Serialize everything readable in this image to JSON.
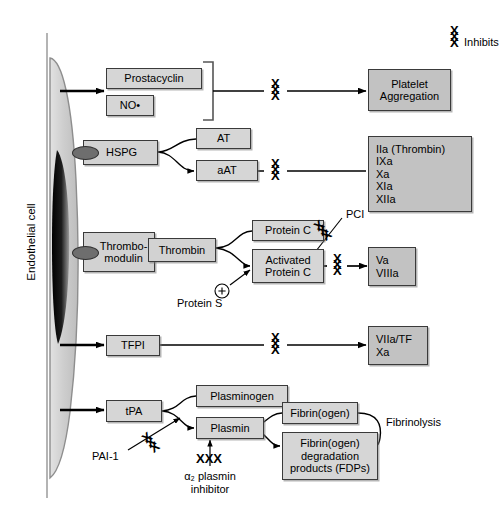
{
  "figure": {
    "cell_label": "Endothelial cell",
    "legend": {
      "symbol": "XXX",
      "text": "Inhibits"
    }
  },
  "pathways": {
    "prostacyclin_row": {
      "mediators": [
        {
          "id": "prostacyclin",
          "label": "Prostacyclin"
        },
        {
          "id": "no",
          "label": "NO•"
        }
      ],
      "target": "Platelet\nAggregation",
      "target_line1": "Platelet",
      "target_line2": "Aggregation"
    },
    "hspg_row": {
      "receptor": "HSPG",
      "intermediate": "AT",
      "activated": "aAT",
      "targets": [
        "IIa (Thrombin)",
        "IXa",
        "Xa",
        "XIa",
        "XIIa"
      ]
    },
    "thrombomodulin_row": {
      "receptor_line1": "Thrombo-",
      "receptor_line2": "modulin",
      "enzyme": "Thrombin",
      "substrate": "Protein C",
      "product_line1": "Activated",
      "product_line2": "Protein C",
      "cofactor": "Protein S",
      "cofactor_symbol": "+",
      "inhibitor": "PCI",
      "targets": [
        "Va",
        "VIIIa"
      ]
    },
    "tfpi_row": {
      "mediator": "TFPI",
      "targets": [
        "VIIa/TF",
        "Xa"
      ]
    },
    "fibrinolysis_row": {
      "mediator": "tPA",
      "zymogen": "Plasminogen",
      "enzyme": "Plasmin",
      "substrate": "Fibrin(ogen)",
      "product_line1": "Fibrin(ogen)",
      "product_line2": "degradation",
      "product_line3": "products (FDPs)",
      "process_label": "Fibrinolysis",
      "inhibitor_tpa": "PAI-1",
      "inhibitor_plasmin_line1": "α₂ plasmin",
      "inhibitor_plasmin_line2": "inhibitor"
    }
  },
  "colors": {
    "box_fill": "#d6d6d6",
    "box_stroke": "#3a3a3a",
    "cell_fill": "#c9c9c9",
    "nucleus": "#111111",
    "background": "#ffffff"
  }
}
